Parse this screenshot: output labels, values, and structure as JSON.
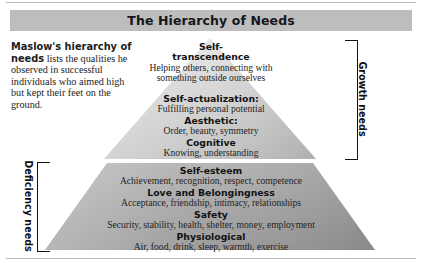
{
  "figure": {
    "title": "The Hierarchy of Needs",
    "description_lead": "Maslow's hierarchy of needs",
    "description_rest": " lists the qualities he observed in successful individuals who aimed high but kept their feet on the ground."
  },
  "colors": {
    "title_bar": "#bdbdbd",
    "pyramid_growth_top": "#e2e2e2",
    "pyramid_growth_bottom": "#c4c4c4",
    "pyramid_deficiency_top": "#b0b0b0",
    "pyramid_deficiency_bottom": "#9a9a9a",
    "text": "#1a1a1a",
    "rule": "#b9b9b9"
  },
  "brackets": {
    "growth": "Growth needs",
    "deficiency": "Deficiency needs"
  },
  "tiers": [
    {
      "key": "self-transcendence",
      "heading": "Self-",
      "heading2": "transcendence",
      "sub": "Helping others, connecting with",
      "sub2": "something outside ourselves",
      "group": "growth"
    },
    {
      "key": "self-actualization",
      "heading": "Self-actualization:",
      "sub": "Fulfilling personal potential",
      "group": "growth"
    },
    {
      "key": "aesthetic",
      "heading": "Aesthetic:",
      "sub": "Order, beauty, symmetry",
      "group": "growth"
    },
    {
      "key": "cognitive",
      "heading": "Cognitive",
      "sub": "Knowing, understanding",
      "group": "growth"
    },
    {
      "key": "self-esteem",
      "heading": "Self-esteem",
      "sub": "Achievement, recognition, respect, competence",
      "group": "deficiency"
    },
    {
      "key": "love-and-belongingness",
      "heading": "Love and Belongingness",
      "sub": "Acceptance, friendship, intimacy, relationships",
      "group": "deficiency"
    },
    {
      "key": "safety",
      "heading": "Safety",
      "sub": "Security, stability, health, shelter, money, employment",
      "group": "deficiency"
    },
    {
      "key": "physiological",
      "heading": "Physiological",
      "sub": "Air, food, drink, sleep, warmth, exercise",
      "group": "deficiency"
    }
  ]
}
